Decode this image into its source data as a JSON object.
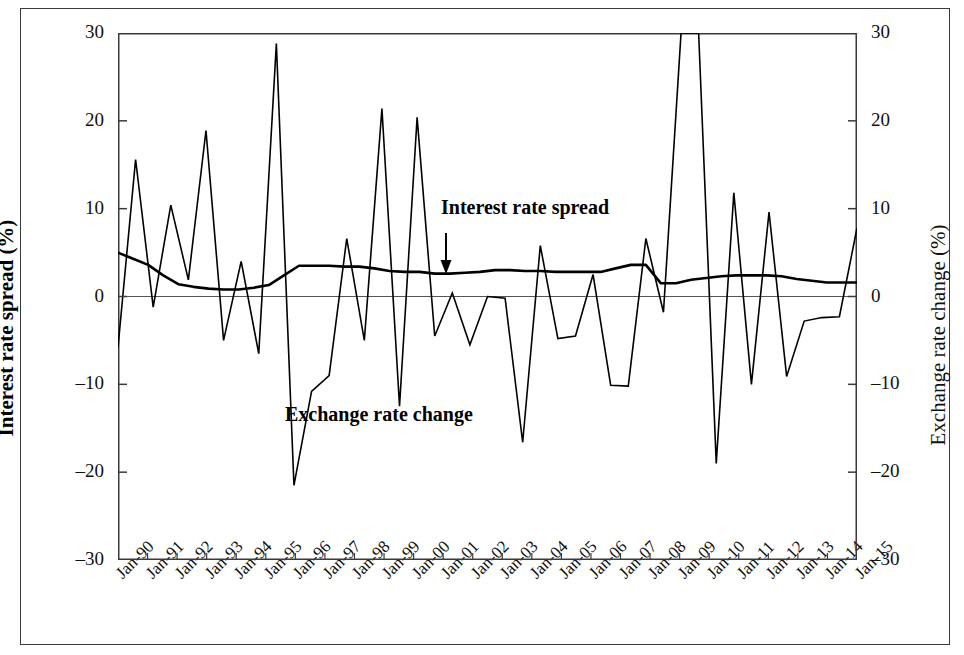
{
  "figure": {
    "left_axis_title": "Interest rate spread (%)",
    "right_axis_title": "Exchange rate change (%)",
    "annotations": [
      {
        "name": "interest-rate-spread",
        "text": "Interest rate spread"
      },
      {
        "name": "exchange-rate-change",
        "text": "Exchange rate change"
      }
    ]
  },
  "chart_data": {
    "type": "line",
    "title": "",
    "xlabel": "",
    "ylabel": "Interest rate spread (%)",
    "y2label": "Exchange rate change (%)",
    "ylim": [
      -30,
      30
    ],
    "y2lim": [
      -30,
      30
    ],
    "yticks": [
      30,
      20,
      10,
      0,
      -10,
      -20,
      -30
    ],
    "ytick_labels": [
      "30",
      "20",
      "10",
      "0",
      "-10",
      "-20",
      "-30"
    ],
    "y2ticks": [
      30,
      20,
      10,
      0,
      -10,
      -20,
      -30
    ],
    "y2tick_labels": [
      "30",
      "20",
      "10",
      "0",
      "-10",
      "-20",
      "-30"
    ],
    "grid": false,
    "legend": "inline-annotations",
    "categories": [
      "Jan-90",
      "Jan-91",
      "Jan-92",
      "Jan-93",
      "Jan-94",
      "Jan-95",
      "Jan-96",
      "Jan-97",
      "Jan-98",
      "Jan-99",
      "Jan-00",
      "Jan-01",
      "Jan-02",
      "Jan-03",
      "Jan-04",
      "Jan-05",
      "Jan-06",
      "Jan-07",
      "Jan-08",
      "Jan-09",
      "Jan-10",
      "Jan-11",
      "Jan-12",
      "Jan-13",
      "Jan-14",
      "Jan-15"
    ],
    "x_tick_rotation": -45,
    "series": [
      {
        "name": "Interest rate spread",
        "axis": "left",
        "color": "#000000",
        "values": [
          5.0,
          3.6,
          1.4,
          0.9,
          0.8,
          1.3,
          3.5,
          3.5,
          3.4,
          2.9,
          2.8,
          2.6,
          2.8,
          3.0,
          2.9,
          2.7,
          2.8,
          2.8,
          3.6,
          1.5,
          2.1,
          2.4,
          2.4,
          2.0,
          1.6,
          1.6
        ]
      },
      {
        "name": "Exchange rate change",
        "axis": "right",
        "color": "#000000",
        "values": [
          -5.8,
          15.6,
          -1.2,
          10.4,
          1.9,
          18.9,
          -5.0,
          4.0,
          -6.5,
          28.8,
          -21.5,
          -10.8,
          -9.0,
          6.6,
          -5.0,
          21.4,
          -12.5,
          20.4,
          -4.5,
          0.4,
          -5.5,
          0.0,
          -0.2,
          -16.6,
          5.8,
          -4.8
        ],
        "note": "Sub-annual detail present; rendered as the densely-sampled path shown in the figure."
      }
    ],
    "spread_monthly": [
      5.0,
      4.3,
      3.6,
      2.4,
      1.4,
      1.1,
      0.9,
      0.8,
      0.8,
      1.0,
      1.3,
      2.4,
      3.5,
      3.5,
      3.5,
      3.4,
      3.4,
      3.2,
      2.9,
      2.8,
      2.8,
      2.6,
      2.6,
      2.7,
      2.8,
      3.0,
      3.0,
      2.9,
      2.9,
      2.8,
      2.8,
      2.8,
      2.8,
      3.2,
      3.6,
      3.6,
      1.5,
      1.5,
      1.9,
      2.1,
      2.3,
      2.4,
      2.4,
      2.4,
      2.3,
      2.0,
      1.8,
      1.6,
      1.6,
      1.6
    ],
    "fx_monthly": [
      -5.8,
      15.6,
      -1.2,
      10.4,
      1.9,
      18.9,
      -5.0,
      4.0,
      -6.5,
      28.8,
      -21.5,
      -10.8,
      -9.0,
      6.6,
      -5.0,
      21.4,
      -12.5,
      20.4,
      -4.5,
      0.4,
      -5.5,
      0.0,
      -0.2,
      -16.6,
      5.8,
      -4.8,
      -4.5,
      2.5,
      -10.1,
      -10.2,
      6.6,
      -1.8,
      30.4,
      30.4,
      -19.0,
      11.8,
      -10.0,
      9.6,
      -9.1,
      -2.8,
      -2.4,
      -2.3,
      7.8
    ],
    "top_clipped_peak": {
      "year": "Jan-08",
      "approx_value": 30.4,
      "note": "spike reaches just above the 30 axis maximum"
    }
  }
}
